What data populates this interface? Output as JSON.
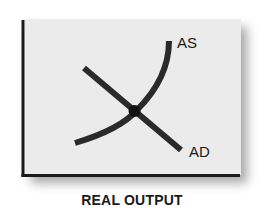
{
  "diagram": {
    "x_axis_label": "REAL OUTPUT",
    "curves": [
      {
        "name": "AS",
        "label": "AS",
        "shape": "upward-sloping convex curve"
      },
      {
        "name": "AD",
        "label": "AD",
        "shape": "downward-sloping straight line"
      }
    ],
    "equilibrium_point": "intersection of AS and AD",
    "colors": {
      "panel": "#ebebeb",
      "lines": "#2a2a2a",
      "axis": "#1a1a1a",
      "text": "#1a1a1a"
    }
  }
}
